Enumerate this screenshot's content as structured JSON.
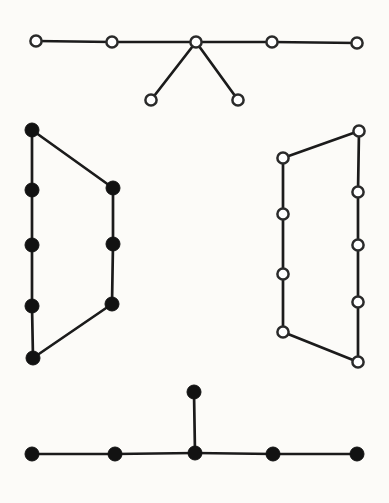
{
  "figure": {
    "width": 389,
    "height": 503,
    "background_color": "#fcfbf8",
    "edge_color": "#1b1b1b",
    "edge_width": 2.7,
    "open_node_fill": "#ffffff",
    "open_node_stroke": "#2a2a2a",
    "open_node_radius": 5.6,
    "open_node_stroke_width": 2.5,
    "filled_node_color": "#121212",
    "filled_node_radius": 7,
    "graphs": [
      {
        "id": "top-caterpillar",
        "node_style": "open",
        "nodes": [
          {
            "x": 36,
            "y": 41
          },
          {
            "x": 112,
            "y": 42
          },
          {
            "x": 196,
            "y": 42
          },
          {
            "x": 272,
            "y": 42
          },
          {
            "x": 357,
            "y": 43
          },
          {
            "x": 151,
            "y": 100
          },
          {
            "x": 238,
            "y": 100
          }
        ],
        "edges": [
          [
            0,
            1
          ],
          [
            1,
            2
          ],
          [
            2,
            3
          ],
          [
            3,
            4
          ],
          [
            2,
            5
          ],
          [
            2,
            6
          ]
        ]
      },
      {
        "id": "left-cycle",
        "node_style": "filled",
        "nodes": [
          {
            "x": 32,
            "y": 130
          },
          {
            "x": 32,
            "y": 190
          },
          {
            "x": 32,
            "y": 245
          },
          {
            "x": 32,
            "y": 306
          },
          {
            "x": 33,
            "y": 358
          },
          {
            "x": 113,
            "y": 188
          },
          {
            "x": 113,
            "y": 244
          },
          {
            "x": 112,
            "y": 304
          }
        ],
        "edges": [
          [
            0,
            1
          ],
          [
            1,
            2
          ],
          [
            2,
            3
          ],
          [
            3,
            4
          ],
          [
            0,
            5
          ],
          [
            5,
            6
          ],
          [
            6,
            7
          ],
          [
            7,
            4
          ]
        ]
      },
      {
        "id": "right-cycle",
        "node_style": "open",
        "nodes": [
          {
            "x": 359,
            "y": 131
          },
          {
            "x": 358,
            "y": 192
          },
          {
            "x": 358,
            "y": 245
          },
          {
            "x": 358,
            "y": 302
          },
          {
            "x": 358,
            "y": 362
          },
          {
            "x": 283,
            "y": 158
          },
          {
            "x": 283,
            "y": 214
          },
          {
            "x": 283,
            "y": 274
          },
          {
            "x": 283,
            "y": 332
          }
        ],
        "edges": [
          [
            0,
            1
          ],
          [
            1,
            2
          ],
          [
            2,
            3
          ],
          [
            3,
            4
          ],
          [
            0,
            5
          ],
          [
            5,
            6
          ],
          [
            6,
            7
          ],
          [
            7,
            8
          ],
          [
            8,
            4
          ]
        ]
      },
      {
        "id": "bottom-caterpillar",
        "node_style": "filled",
        "nodes": [
          {
            "x": 32,
            "y": 454
          },
          {
            "x": 115,
            "y": 454
          },
          {
            "x": 195,
            "y": 453
          },
          {
            "x": 273,
            "y": 454
          },
          {
            "x": 357,
            "y": 454
          },
          {
            "x": 194,
            "y": 392
          }
        ],
        "edges": [
          [
            0,
            1
          ],
          [
            1,
            2
          ],
          [
            2,
            3
          ],
          [
            3,
            4
          ],
          [
            2,
            5
          ]
        ]
      }
    ]
  }
}
